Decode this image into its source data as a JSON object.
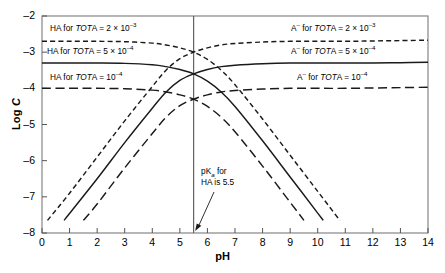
{
  "chart_data": {
    "type": "line",
    "title": "",
    "xlabel": "pH",
    "ylabel": "Log C",
    "xlim": [
      0,
      14
    ],
    "ylim": [
      -8,
      -2
    ],
    "grid": false,
    "legend_position": "inline-labels",
    "xticks": [
      "0",
      "1",
      "2",
      "3",
      "4",
      "5",
      "6",
      "7",
      "8",
      "9",
      "10",
      "11",
      "12",
      "13",
      "14"
    ],
    "yticks": [
      "-2",
      "-3",
      "-4",
      "-5",
      "-6",
      "-7",
      "-8"
    ],
    "pKa": 5.5,
    "series": [
      {
        "name": "HA for TOTA = 2 x 10^-3",
        "style": "short-dash",
        "plateau": -2.7,
        "crossing_ph": 5.5,
        "crossing_value": -3.0,
        "end_ph": 10.8,
        "points_x": [
          0,
          1,
          2,
          3,
          4,
          4.5,
          5,
          5.5,
          6,
          6.5,
          7,
          8,
          9,
          10,
          10.8
        ],
        "points_y": [
          -2.7,
          -2.7,
          -2.7,
          -2.71,
          -2.75,
          -2.8,
          -2.88,
          -3.0,
          -3.2,
          -3.5,
          -3.9,
          -4.85,
          -5.85,
          -6.85,
          -7.65
        ]
      },
      {
        "name": "HA for TOTA = 5 x 10^-4",
        "style": "solid",
        "plateau": -3.3,
        "crossing_ph": 5.5,
        "crossing_value": -3.6,
        "end_ph": 10.2,
        "points_x": [
          0,
          1,
          2,
          3,
          4,
          4.5,
          5,
          5.5,
          6,
          6.5,
          7,
          8,
          9,
          10,
          10.2
        ],
        "points_y": [
          -3.3,
          -3.3,
          -3.3,
          -3.31,
          -3.35,
          -3.4,
          -3.48,
          -3.6,
          -3.8,
          -4.1,
          -4.5,
          -5.45,
          -6.45,
          -7.45,
          -7.65
        ]
      },
      {
        "name": "HA for TOTA = 10^-4",
        "style": "long-dash",
        "plateau": -4.0,
        "crossing_ph": 5.5,
        "crossing_value": -4.3,
        "end_ph": 9.5,
        "points_x": [
          0,
          1,
          2,
          3,
          4,
          4.5,
          5,
          5.5,
          6,
          6.5,
          7,
          8,
          9,
          9.5
        ],
        "points_y": [
          -4.0,
          -4.0,
          -4.0,
          -4.01,
          -4.05,
          -4.1,
          -4.18,
          -4.3,
          -4.5,
          -4.8,
          -5.2,
          -6.15,
          -7.15,
          -7.65
        ]
      },
      {
        "name": "A- for TOTA = 2 x 10^-3",
        "style": "short-dash",
        "plateau": -2.7,
        "crossing_ph": 5.5,
        "crossing_value": -3.0,
        "start_ph": 0.2,
        "points_x": [
          0.2,
          1,
          2,
          3,
          4,
          4.5,
          5,
          5.5,
          6,
          6.5,
          7,
          8,
          9,
          10,
          11,
          12,
          13,
          14
        ],
        "points_y": [
          -7.65,
          -6.9,
          -5.9,
          -4.9,
          -3.95,
          -3.5,
          -3.18,
          -3.0,
          -2.88,
          -2.8,
          -2.76,
          -2.72,
          -2.7,
          -2.7,
          -2.7,
          -2.69,
          -2.68,
          -2.67
        ]
      },
      {
        "name": "A- for TOTA = 5 x 10^-4",
        "style": "solid",
        "plateau": -3.3,
        "crossing_ph": 5.5,
        "crossing_value": -3.6,
        "start_ph": 0.8,
        "points_x": [
          0.8,
          2,
          3,
          4,
          4.5,
          5,
          5.5,
          6,
          6.5,
          7,
          8,
          9,
          10,
          11,
          12,
          13,
          14
        ],
        "points_y": [
          -7.65,
          -6.5,
          -5.5,
          -4.55,
          -4.1,
          -3.78,
          -3.6,
          -3.48,
          -3.4,
          -3.36,
          -3.32,
          -3.3,
          -3.3,
          -3.3,
          -3.3,
          -3.29,
          -3.28
        ]
      },
      {
        "name": "A- for TOTA = 10^-4",
        "style": "long-dash",
        "plateau": -4.0,
        "crossing_ph": 5.5,
        "crossing_value": -4.3,
        "start_ph": 1.5,
        "points_x": [
          1.5,
          2,
          3,
          4,
          4.5,
          5,
          5.5,
          6,
          6.5,
          7,
          8,
          9,
          10,
          11,
          12,
          13,
          14
        ],
        "points_y": [
          -7.65,
          -7.2,
          -6.2,
          -5.25,
          -4.8,
          -4.48,
          -4.3,
          -4.18,
          -4.1,
          -4.06,
          -4.02,
          -4.0,
          -4.0,
          -4.0,
          -3.99,
          -3.98,
          -3.97
        ]
      }
    ]
  },
  "labels": {
    "ha_1": {
      "pre": "HA for ",
      "it": "TOT",
      "mid": "A = 2 × 10",
      "sup": "–3"
    },
    "ha_2": {
      "pre": "HA for ",
      "it": "TOT",
      "mid": "A = 5 × 10",
      "sup": "–4"
    },
    "ha_3": {
      "pre": "HA for ",
      "it": "TOT",
      "mid": "A = 10",
      "sup": "–4"
    },
    "a_1": {
      "pre": "A",
      "presup": "–",
      "mid0": " for ",
      "it": "TOT",
      "mid": "A = 2 × 10",
      "sup": "–3"
    },
    "a_2": {
      "pre": "A",
      "presup": "–",
      "mid0": " for ",
      "it": "TOT",
      "mid": "A = 5 × 10",
      "sup": "–4"
    },
    "a_3": {
      "pre": "A",
      "presup": "–",
      "mid0": " for ",
      "it": "TOT",
      "mid": "A = 10",
      "sup": "–4"
    }
  },
  "annotation": {
    "line1_pre": "p",
    "line1_k": "K",
    "line1_sub": "a",
    "line1_post": " for",
    "line2": "HA is 5.5"
  },
  "axis": {
    "ylabel_text": "Log ",
    "ylabel_italic": "C",
    "xlabel_text": "pH"
  },
  "colors": {
    "curve": "#1a1a1a",
    "axis": "#555555",
    "frame": "#7a7a7a",
    "background": "#ffffff"
  }
}
